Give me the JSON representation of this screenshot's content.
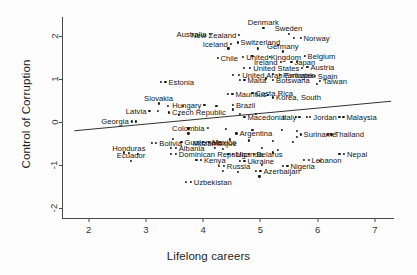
{
  "chart_data": {
    "type": "scatter",
    "title": "",
    "xlabel": "Lifelong careers",
    "ylabel": "Control of Corruption",
    "xlim": [
      1.55,
      7.35
    ],
    "ylim": [
      -2.25,
      2.45
    ],
    "xticks": [
      2,
      3,
      4,
      5,
      6,
      7
    ],
    "yticks": [
      2,
      1,
      0,
      -1,
      -2
    ],
    "grid": false,
    "legend": null,
    "marker_color": "#1a1a1a",
    "fit_line": {
      "label": "linear fit",
      "x": [
        1.75,
        7.3
      ],
      "y": [
        -0.21,
        0.48
      ]
    },
    "points": [
      {
        "label": "Australia",
        "x": 4.11,
        "y": 2.05,
        "anchor": "right"
      },
      {
        "label": "New Zealand",
        "x": 4.63,
        "y": 2.04,
        "anchor": "right"
      },
      {
        "label": "Denmark",
        "x": 5.05,
        "y": 2.2,
        "anchor": "center"
      },
      {
        "label": "Sweden",
        "x": 5.49,
        "y": 2.06,
        "anchor": "center"
      },
      {
        "label": "Norway",
        "x": 5.7,
        "y": 1.97,
        "anchor": "left"
      },
      {
        "label": "Iceland",
        "x": 4.48,
        "y": 1.83,
        "anchor": "right"
      },
      {
        "label": "Switzerland",
        "x": 4.6,
        "y": 1.86,
        "anchor": "left"
      },
      {
        "label": "Germany",
        "x": 5.39,
        "y": 1.65,
        "anchor": "center"
      },
      {
        "label": "Belgium",
        "x": 5.77,
        "y": 1.54,
        "anchor": "left"
      },
      {
        "label": "United Kingdom",
        "x": 4.7,
        "y": 1.52,
        "anchor": "left"
      },
      {
        "label": "Chile",
        "x": 4.25,
        "y": 1.5,
        "anchor": "left"
      },
      {
        "label": "Ireland",
        "x": 5.35,
        "y": 1.41,
        "anchor": "right"
      },
      {
        "label": "Japan",
        "x": 5.54,
        "y": 1.41,
        "anchor": "left"
      },
      {
        "label": "Austria",
        "x": 5.82,
        "y": 1.28,
        "anchor": "left"
      },
      {
        "label": "United States",
        "x": 4.82,
        "y": 1.26,
        "anchor": "left"
      },
      {
        "label": "United Arab Emirates",
        "x": 4.63,
        "y": 1.11,
        "anchor": "left"
      },
      {
        "label": "Portugal",
        "x": 5.34,
        "y": 1.11,
        "anchor": "left"
      },
      {
        "label": "Spain",
        "x": 5.95,
        "y": 1.08,
        "anchor": "left"
      },
      {
        "label": "Malta",
        "x": 4.72,
        "y": 0.99,
        "anchor": "left"
      },
      {
        "label": "Botswana",
        "x": 5.22,
        "y": 0.99,
        "anchor": "left"
      },
      {
        "label": "Taiwan",
        "x": 6.04,
        "y": 0.96,
        "anchor": "left"
      },
      {
        "label": "Estonia",
        "x": 3.34,
        "y": 0.94,
        "anchor": "left"
      },
      {
        "label": "Mauritius",
        "x": 4.51,
        "y": 0.67,
        "anchor": "left"
      },
      {
        "label": "Costa Rica",
        "x": 4.86,
        "y": 0.68,
        "anchor": "left"
      },
      {
        "label": "Korea, South",
        "x": 5.22,
        "y": 0.58,
        "anchor": "left"
      },
      {
        "label": "Slovakia",
        "x": 3.22,
        "y": 0.44,
        "anchor": "center"
      },
      {
        "label": "Hungary",
        "x": 4.02,
        "y": 0.41,
        "anchor": "right"
      },
      {
        "label": "Brazil",
        "x": 4.52,
        "y": 0.4,
        "anchor": "left"
      },
      {
        "label": "Latvia",
        "x": 3.06,
        "y": 0.26,
        "anchor": "right"
      },
      {
        "label": "Czech Republic",
        "x": 3.4,
        "y": 0.23,
        "anchor": "left"
      },
      {
        "label": "Macedonia",
        "x": 4.72,
        "y": 0.12,
        "anchor": "left"
      },
      {
        "label": "Italy",
        "x": 5.68,
        "y": 0.13,
        "anchor": "right"
      },
      {
        "label": "Jordan",
        "x": 5.87,
        "y": 0.13,
        "anchor": "left"
      },
      {
        "label": "Malaysia",
        "x": 6.45,
        "y": 0.13,
        "anchor": "left"
      },
      {
        "label": "Georgia",
        "x": 2.75,
        "y": 0.02,
        "anchor": "right"
      },
      {
        "label": "Colombia",
        "x": 3.74,
        "y": -0.26,
        "anchor": "center"
      },
      {
        "label": "Argentina",
        "x": 4.58,
        "y": -0.26,
        "anchor": "left"
      },
      {
        "label": "Suriname",
        "x": 5.7,
        "y": -0.28,
        "anchor": "left"
      },
      {
        "label": "Thailand",
        "x": 6.24,
        "y": -0.28,
        "anchor": "left"
      },
      {
        "label": "Bolivia",
        "x": 3.18,
        "y": -0.48,
        "anchor": "left"
      },
      {
        "label": "Guatemala",
        "x": 3.62,
        "y": -0.45,
        "anchor": "left"
      },
      {
        "label": "Mexico",
        "x": 4.1,
        "y": -0.45,
        "anchor": "left"
      },
      {
        "label": "Albania",
        "x": 3.52,
        "y": -0.6,
        "anchor": "left"
      },
      {
        "label": "Mozambique",
        "x": 4.2,
        "y": -0.6,
        "anchor": "center"
      },
      {
        "label": "Honduras",
        "x": 2.7,
        "y": -0.72,
        "anchor": "center"
      },
      {
        "label": "Dominican Republic",
        "x": 3.52,
        "y": -0.73,
        "anchor": "left"
      },
      {
        "label": "Uganda",
        "x": 4.52,
        "y": -0.73,
        "anchor": "left"
      },
      {
        "label": "Belarus",
        "x": 4.88,
        "y": -0.74,
        "anchor": "left"
      },
      {
        "label": "Nepal",
        "x": 6.46,
        "y": -0.74,
        "anchor": "left"
      },
      {
        "label": "Lebanon",
        "x": 5.84,
        "y": -0.88,
        "anchor": "left"
      },
      {
        "label": "Ecuador",
        "x": 2.74,
        "y": -0.89,
        "anchor": "center"
      },
      {
        "label": "Kenya",
        "x": 3.96,
        "y": -0.88,
        "anchor": "left"
      },
      {
        "label": "Ukraine",
        "x": 4.72,
        "y": -0.9,
        "anchor": "left"
      },
      {
        "label": "Russia",
        "x": 4.36,
        "y": -1.02,
        "anchor": "left"
      },
      {
        "label": "Nigeria",
        "x": 5.47,
        "y": -1.01,
        "anchor": "left"
      },
      {
        "label": "Azerbaijan",
        "x": 5.0,
        "y": -1.13,
        "anchor": "left"
      },
      {
        "label": "Uzbekistan",
        "x": 3.78,
        "y": -1.39,
        "anchor": "left"
      }
    ],
    "extra_points": [
      {
        "x": 4.95,
        "y": 1.72
      },
      {
        "x": 5.31,
        "y": 1.8
      },
      {
        "x": 5.58,
        "y": 1.97
      },
      {
        "x": 4.44,
        "y": 1.72
      },
      {
        "x": 4.86,
        "y": 1.55
      },
      {
        "x": 5.17,
        "y": 1.53
      },
      {
        "x": 5.63,
        "y": 1.41
      },
      {
        "x": 5.73,
        "y": 1.27
      },
      {
        "x": 4.71,
        "y": 1.26
      },
      {
        "x": 5.21,
        "y": 1.12
      },
      {
        "x": 5.9,
        "y": 1.08
      },
      {
        "x": 4.52,
        "y": 1.11
      },
      {
        "x": 4.64,
        "y": 0.99
      },
      {
        "x": 5.09,
        "y": 1.02
      },
      {
        "x": 5.99,
        "y": 0.9
      },
      {
        "x": 3.26,
        "y": 0.94
      },
      {
        "x": 4.43,
        "y": 0.67
      },
      {
        "x": 5.13,
        "y": 0.63
      },
      {
        "x": 3.38,
        "y": 0.39
      },
      {
        "x": 3.64,
        "y": 0.39
      },
      {
        "x": 4.23,
        "y": 0.38
      },
      {
        "x": 4.52,
        "y": 0.3
      },
      {
        "x": 3.21,
        "y": 0.26
      },
      {
        "x": 3.58,
        "y": 0.17
      },
      {
        "x": 4.64,
        "y": 0.19
      },
      {
        "x": 4.92,
        "y": 0.2
      },
      {
        "x": 2.83,
        "y": 0.02
      },
      {
        "x": 5.62,
        "y": 0.13
      },
      {
        "x": 5.81,
        "y": 0.13
      },
      {
        "x": 6.38,
        "y": 0.13
      },
      {
        "x": 3.74,
        "y": -0.14
      },
      {
        "x": 4.08,
        "y": -0.13
      },
      {
        "x": 4.39,
        "y": -0.16
      },
      {
        "x": 4.86,
        "y": -0.18
      },
      {
        "x": 5.38,
        "y": -0.18
      },
      {
        "x": 5.64,
        "y": -0.2
      },
      {
        "x": 5.64,
        "y": -0.34
      },
      {
        "x": 6.18,
        "y": -0.28
      },
      {
        "x": 3.11,
        "y": -0.48
      },
      {
        "x": 3.47,
        "y": -0.38
      },
      {
        "x": 4.0,
        "y": -0.45
      },
      {
        "x": 4.47,
        "y": -0.4
      },
      {
        "x": 4.8,
        "y": -0.42
      },
      {
        "x": 5.22,
        "y": -0.44
      },
      {
        "x": 5.56,
        "y": -0.46
      },
      {
        "x": 3.44,
        "y": -0.6
      },
      {
        "x": 4.34,
        "y": -0.62
      },
      {
        "x": 5.02,
        "y": -0.6
      },
      {
        "x": 5.31,
        "y": -0.64
      },
      {
        "x": 2.62,
        "y": -0.7
      },
      {
        "x": 2.86,
        "y": -0.74
      },
      {
        "x": 3.44,
        "y": -0.73
      },
      {
        "x": 4.44,
        "y": -0.73
      },
      {
        "x": 4.8,
        "y": -0.74
      },
      {
        "x": 5.21,
        "y": -0.7
      },
      {
        "x": 6.38,
        "y": -0.74
      },
      {
        "x": 5.76,
        "y": -0.88
      },
      {
        "x": 3.88,
        "y": -0.88
      },
      {
        "x": 4.64,
        "y": -0.9
      },
      {
        "x": 6.04,
        "y": -0.9
      },
      {
        "x": 4.28,
        "y": -1.02
      },
      {
        "x": 5.39,
        "y": -1.01
      },
      {
        "x": 4.92,
        "y": -1.13
      },
      {
        "x": 4.34,
        "y": -1.14
      },
      {
        "x": 4.6,
        "y": -1.16
      },
      {
        "x": 3.7,
        "y": -1.39
      },
      {
        "x": 4.98,
        "y": -1.26
      },
      {
        "x": 5.02,
        "y": -1.0
      }
    ]
  }
}
